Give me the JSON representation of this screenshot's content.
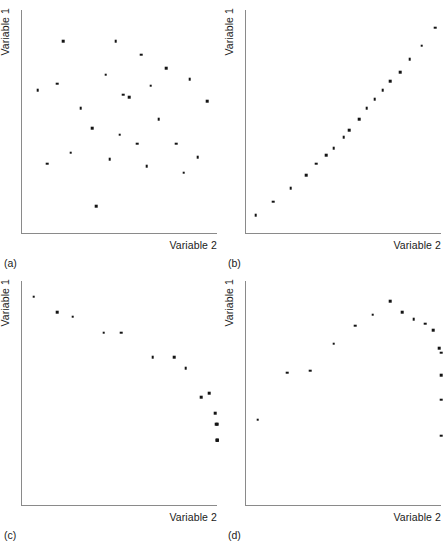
{
  "figure": {
    "background_color": "#ffffff",
    "axis_color": "#8a8a8a",
    "marker_color": "#141414"
  },
  "chart_data": [
    {
      "type": "scatter",
      "panel": "(a)",
      "title": "",
      "xlabel": "Variable 2",
      "ylabel": "Variable 1",
      "xlim": [
        0,
        100
      ],
      "ylim": [
        0,
        100
      ],
      "grid": false,
      "legend": "none",
      "relationship": "no correlation / random scatter",
      "x": [
        21,
        48,
        61,
        74,
        8,
        43,
        18,
        52,
        30,
        66,
        86,
        55,
        95,
        36,
        70,
        79,
        25,
        13,
        59,
        90,
        45,
        83,
        64,
        38,
        50
      ],
      "y": [
        86,
        86,
        80,
        74,
        64,
        71,
        67,
        62,
        56,
        66,
        69,
        61,
        59,
        47,
        51,
        40,
        36,
        31,
        40,
        34,
        33,
        27,
        30,
        12,
        44
      ]
    },
    {
      "type": "scatter",
      "panel": "(b)",
      "title": "",
      "xlabel": "Variable 2",
      "ylabel": "Variable 1",
      "xlim": [
        0,
        100
      ],
      "ylim": [
        0,
        100
      ],
      "grid": false,
      "legend": "none",
      "relationship": "strong positive linear",
      "x": [
        5,
        14,
        23,
        31,
        36,
        41,
        45,
        50,
        53,
        58,
        62,
        66,
        70,
        74,
        79,
        84,
        90,
        97
      ],
      "y": [
        8,
        14,
        20,
        26,
        31,
        35,
        38,
        43,
        46,
        51,
        56,
        60,
        64,
        68,
        72,
        78,
        84,
        92
      ]
    },
    {
      "type": "scatter",
      "panel": "(c)",
      "title": "",
      "xlabel": "Variable 2",
      "ylabel": "Variable 1",
      "xlim": [
        0,
        100
      ],
      "ylim": [
        0,
        100
      ],
      "grid": false,
      "legend": "none",
      "relationship": "negative linear",
      "x": [
        6,
        18,
        26,
        42,
        51,
        67,
        78,
        84,
        92,
        96,
        99,
        99.5,
        100,
        100,
        100,
        100
      ],
      "y": [
        93,
        86,
        84,
        77,
        77,
        66,
        66,
        61,
        48,
        50,
        41,
        36,
        36,
        29,
        29,
        29
      ]
    },
    {
      "type": "scatter",
      "panel": "(d)",
      "title": "",
      "xlabel": "Variable 2",
      "ylabel": "Variable 1",
      "xlim": [
        0,
        100
      ],
      "ylim": [
        0,
        100
      ],
      "grid": false,
      "legend": "none",
      "relationship": "curvilinear (inverted-U)",
      "x": [
        6,
        21,
        33,
        45,
        56,
        65,
        74,
        80,
        86,
        92,
        96,
        99,
        100,
        100,
        100,
        100
      ],
      "y": [
        38,
        59,
        60,
        72,
        80,
        85,
        91,
        86,
        83,
        81,
        78,
        70,
        68,
        58,
        47,
        31
      ]
    }
  ],
  "panels": [
    {
      "id": "a",
      "caption": "(a)",
      "xlabel": "Variable 2",
      "ylabel": "Variable 1"
    },
    {
      "id": "b",
      "caption": "(b)",
      "xlabel": "Variable 2",
      "ylabel": "Variable 1"
    },
    {
      "id": "c",
      "caption": "(c)",
      "xlabel": "Variable 2",
      "ylabel": "Variable 1"
    },
    {
      "id": "d",
      "caption": "(d)",
      "xlabel": "Variable 2",
      "ylabel": "Variable 1"
    }
  ]
}
